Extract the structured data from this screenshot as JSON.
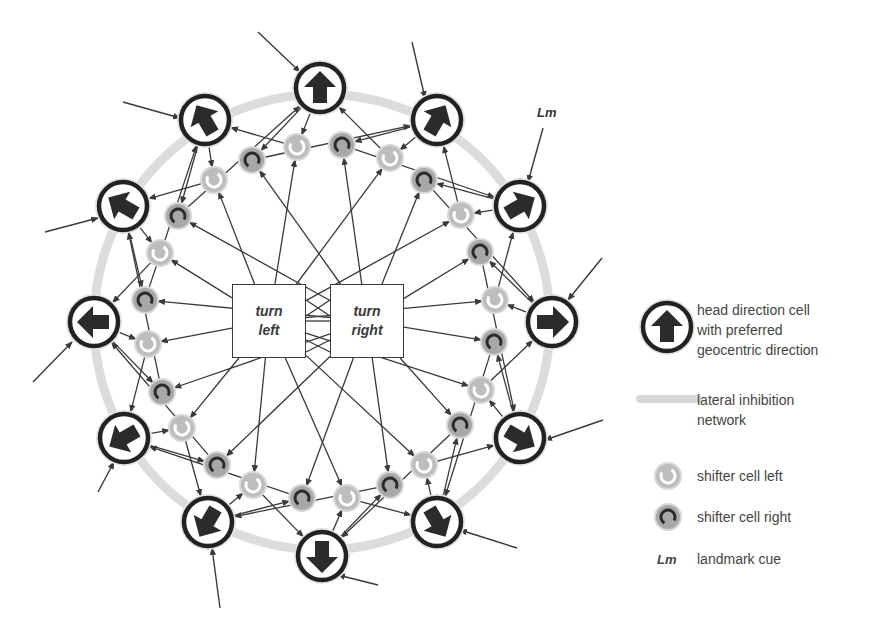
{
  "colors": {
    "ring": "#dcdcdc",
    "cell_border": "#222222",
    "arrow_fill": "#2b2b2b",
    "line": "#3a3a3a",
    "shifter_left_fill": "#bdbdbd",
    "shifter_left_ring": "#ffffff",
    "shifter_right_fill": "#a8a8a8",
    "shifter_right_ring": "#2b2b2b"
  },
  "ring": {
    "cx": 322,
    "cy": 322,
    "r": 228
  },
  "turn_boxes": {
    "left": {
      "line1": "turn",
      "line2": "left",
      "x": 232,
      "y": 284
    },
    "right": {
      "line1": "turn",
      "line2": "right",
      "x": 330,
      "y": 284
    }
  },
  "head_direction_cells": [
    {
      "name": "north",
      "x": 320,
      "y": 88,
      "angle": 0
    },
    {
      "name": "north-east",
      "x": 437,
      "y": 120,
      "angle": 30
    },
    {
      "name": "east-north-east",
      "x": 520,
      "y": 206,
      "angle": 60
    },
    {
      "name": "east",
      "x": 552,
      "y": 322,
      "angle": 90
    },
    {
      "name": "east-south-east",
      "x": 520,
      "y": 438,
      "angle": 120
    },
    {
      "name": "south-east",
      "x": 437,
      "y": 522,
      "angle": 150
    },
    {
      "name": "south",
      "x": 322,
      "y": 556,
      "angle": 180
    },
    {
      "name": "south-west",
      "x": 208,
      "y": 522,
      "angle": 210
    },
    {
      "name": "west-south-west",
      "x": 124,
      "y": 438,
      "angle": 240
    },
    {
      "name": "west",
      "x": 94,
      "y": 322,
      "angle": 270
    },
    {
      "name": "west-north-west",
      "x": 123,
      "y": 206,
      "angle": 300
    },
    {
      "name": "north-west",
      "x": 205,
      "y": 120,
      "angle": 330
    }
  ],
  "shifter_cells": [
    {
      "type": "left",
      "x": 297,
      "y": 147
    },
    {
      "type": "right",
      "x": 342,
      "y": 145
    },
    {
      "type": "left",
      "x": 390,
      "y": 158
    },
    {
      "type": "right",
      "x": 424,
      "y": 180
    },
    {
      "type": "left",
      "x": 461,
      "y": 215
    },
    {
      "type": "right",
      "x": 480,
      "y": 252
    },
    {
      "type": "left",
      "x": 495,
      "y": 300
    },
    {
      "type": "right",
      "x": 494,
      "y": 342
    },
    {
      "type": "left",
      "x": 481,
      "y": 390
    },
    {
      "type": "right",
      "x": 460,
      "y": 425
    },
    {
      "type": "left",
      "x": 424,
      "y": 465
    },
    {
      "type": "right",
      "x": 390,
      "y": 485
    },
    {
      "type": "left",
      "x": 347,
      "y": 498
    },
    {
      "type": "right",
      "x": 302,
      "y": 498
    },
    {
      "type": "left",
      "x": 253,
      "y": 485
    },
    {
      "type": "right",
      "x": 217,
      "y": 465
    },
    {
      "type": "left",
      "x": 182,
      "y": 428
    },
    {
      "type": "right",
      "x": 162,
      "y": 392
    },
    {
      "type": "left",
      "x": 148,
      "y": 344
    },
    {
      "type": "right",
      "x": 145,
      "y": 300
    },
    {
      "type": "left",
      "x": 160,
      "y": 253
    },
    {
      "type": "right",
      "x": 178,
      "y": 216
    },
    {
      "type": "left",
      "x": 214,
      "y": 180
    },
    {
      "type": "right",
      "x": 252,
      "y": 160
    }
  ],
  "landmark_inputs": [
    {
      "x1": 258,
      "y1": 32,
      "x2": 300,
      "y2": 72
    },
    {
      "x1": 412,
      "y1": 42,
      "x2": 425,
      "y2": 98
    },
    {
      "x1": 543,
      "y1": 128,
      "x2": 528,
      "y2": 182
    },
    {
      "x1": 602,
      "y1": 258,
      "x2": 568,
      "y2": 300
    },
    {
      "x1": 603,
      "y1": 420,
      "x2": 545,
      "y2": 440
    },
    {
      "x1": 517,
      "y1": 548,
      "x2": 460,
      "y2": 530
    },
    {
      "x1": 378,
      "y1": 585,
      "x2": 338,
      "y2": 575
    },
    {
      "x1": 220,
      "y1": 608,
      "x2": 212,
      "y2": 548
    },
    {
      "x1": 98,
      "y1": 492,
      "x2": 114,
      "y2": 462
    },
    {
      "x1": 33,
      "y1": 382,
      "x2": 72,
      "y2": 342
    },
    {
      "x1": 45,
      "y1": 232,
      "x2": 98,
      "y2": 218
    },
    {
      "x1": 123,
      "y1": 102,
      "x2": 180,
      "y2": 118
    }
  ],
  "landmark_label": {
    "text": "Lm",
    "x": 537,
    "y": 105
  },
  "legend": {
    "items": [
      {
        "icon": "head-direction-cell",
        "lines": [
          "head direction cell",
          "with preferred",
          "geocentric direction"
        ]
      },
      {
        "icon": "lateral-inhibition",
        "lines": [
          "lateral inhibition",
          "network"
        ]
      },
      {
        "icon": "shifter-left",
        "lines": [
          "shifter cell left"
        ]
      },
      {
        "icon": "shifter-right",
        "lines": [
          "shifter cell right"
        ]
      },
      {
        "icon": "landmark",
        "symbol": "Lm",
        "lines": [
          "landmark cue"
        ]
      }
    ],
    "hd_text": "head direction cell\nwith preferred\ngeocentric direction",
    "li_text": "lateral inhibition\nnetwork",
    "sl_text": "shifter cell left",
    "sr_text": "shifter cell right",
    "lm_symbol": "Lm",
    "lm_text": "landmark cue"
  }
}
